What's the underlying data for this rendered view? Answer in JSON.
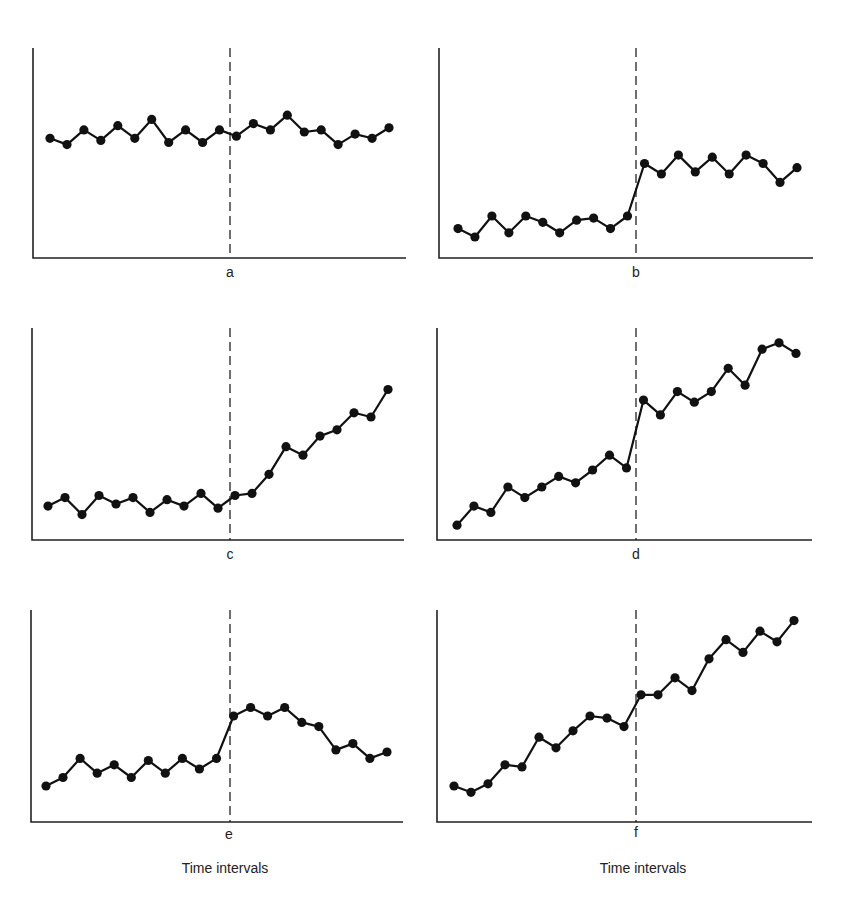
{
  "chart_data": [
    {
      "type": "line",
      "panel": "a",
      "label": "a",
      "title": "",
      "xlabel": "",
      "ylabel": "",
      "intervention_after_index": 10,
      "ylim": [
        0,
        100
      ],
      "grid": false,
      "x": [
        1,
        2,
        3,
        4,
        5,
        6,
        7,
        8,
        9,
        10,
        11,
        12,
        13,
        14,
        15,
        16,
        17,
        18,
        19,
        20,
        21
      ],
      "values": [
        57,
        54,
        61,
        56,
        63,
        57,
        66,
        55,
        61,
        55,
        61,
        58,
        64,
        61,
        68,
        60,
        61,
        54,
        59,
        57,
        62
      ],
      "box": {
        "left": 33,
        "top": 48,
        "right": 406,
        "bottom": 258,
        "dash_x": 230,
        "x0": 50,
        "x1": 389
      }
    },
    {
      "type": "line",
      "panel": "b",
      "label": "b",
      "title": "",
      "xlabel": "",
      "ylabel": "",
      "intervention_after_index": 10,
      "ylim": [
        0,
        100
      ],
      "grid": false,
      "x": [
        1,
        2,
        3,
        4,
        5,
        6,
        7,
        8,
        9,
        10,
        11,
        12,
        13,
        14,
        15,
        16,
        17,
        18,
        19,
        20,
        21
      ],
      "values": [
        14,
        10,
        20,
        12,
        20,
        17,
        12,
        18,
        19,
        14,
        20,
        45,
        40,
        49,
        41,
        48,
        40,
        49,
        45,
        36,
        43
      ],
      "box": {
        "left": 439,
        "top": 48,
        "right": 813,
        "bottom": 258,
        "dash_x": 636,
        "x0": 458,
        "x1": 797
      }
    },
    {
      "type": "line",
      "panel": "c",
      "label": "c",
      "title": "",
      "xlabel": "",
      "ylabel": "",
      "intervention_after_index": 10,
      "ylim": [
        0,
        100
      ],
      "grid": false,
      "x": [
        1,
        2,
        3,
        4,
        5,
        6,
        7,
        8,
        9,
        10,
        11,
        12,
        13,
        14,
        15,
        16,
        17,
        18,
        19,
        20,
        21
      ],
      "values": [
        16,
        20,
        12,
        21,
        17,
        20,
        13,
        19,
        16,
        22,
        15,
        21,
        22,
        31,
        44,
        40,
        49,
        52,
        60,
        58,
        71
      ],
      "box": {
        "left": 32,
        "top": 328,
        "right": 404,
        "bottom": 540,
        "dash_x": 230,
        "x0": 48,
        "x1": 388
      }
    },
    {
      "type": "line",
      "panel": "d",
      "label": "d",
      "title": "",
      "xlabel": "",
      "ylabel": "",
      "intervention_after_index": 10,
      "ylim": [
        0,
        100
      ],
      "grid": false,
      "x": [
        1,
        2,
        3,
        4,
        5,
        6,
        7,
        8,
        9,
        10,
        11,
        12,
        13,
        14,
        15,
        16,
        17,
        18,
        19,
        20,
        21
      ],
      "values": [
        7,
        16,
        13,
        25,
        20,
        25,
        30,
        27,
        33,
        40,
        34,
        66,
        59,
        70,
        65,
        70,
        81,
        73,
        90,
        93,
        88
      ],
      "box": {
        "left": 437,
        "top": 328,
        "right": 812,
        "bottom": 540,
        "dash_x": 636,
        "x0": 457,
        "x1": 796
      }
    },
    {
      "type": "line",
      "panel": "e",
      "label": "e",
      "title": "",
      "xlabel": "Time intervals",
      "ylabel": "",
      "intervention_after_index": 10,
      "ylim": [
        0,
        100
      ],
      "grid": false,
      "x": [
        1,
        2,
        3,
        4,
        5,
        6,
        7,
        8,
        9,
        10,
        11,
        12,
        13,
        14,
        15,
        16,
        17,
        18,
        19,
        20,
        21
      ],
      "values": [
        17,
        21,
        30,
        23,
        27,
        21,
        29,
        23,
        30,
        25,
        30,
        50,
        54,
        50,
        54,
        47,
        45,
        34,
        37,
        30,
        33
      ],
      "box": {
        "left": 31,
        "top": 610,
        "right": 403,
        "bottom": 822,
        "dash_x": 230,
        "x0": 46,
        "x1": 387
      }
    },
    {
      "type": "line",
      "panel": "f",
      "label": "f",
      "title": "",
      "xlabel": "Time intervals",
      "ylabel": "",
      "intervention_after_index": 10,
      "ylim": [
        0,
        100
      ],
      "grid": false,
      "x": [
        1,
        2,
        3,
        4,
        5,
        6,
        7,
        8,
        9,
        10,
        11,
        12,
        13,
        14,
        15,
        16,
        17,
        18,
        19,
        20,
        21
      ],
      "values": [
        17,
        14,
        18,
        27,
        26,
        40,
        35,
        43,
        50,
        49,
        45,
        60,
        60,
        68,
        62,
        77,
        86,
        80,
        90,
        85,
        95
      ],
      "box": {
        "left": 437,
        "top": 610,
        "right": 812,
        "bottom": 822,
        "dash_x": 636,
        "x0": 454,
        "x1": 794
      }
    }
  ],
  "labels": {
    "panel_a": "a",
    "panel_b": "b",
    "panel_c": "c",
    "panel_d": "d",
    "panel_e": "e",
    "panel_f": "f",
    "xlabel_left": "Time intervals",
    "xlabel_right": "Time intervals"
  },
  "colors": {
    "line": "#111111",
    "axis": "#222222",
    "background": "#ffffff"
  }
}
